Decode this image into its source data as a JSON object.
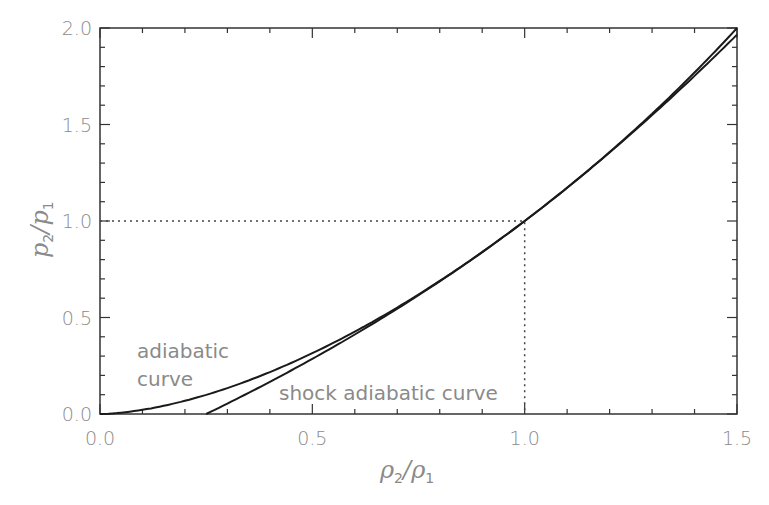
{
  "chart_data": {
    "type": "line",
    "title": "",
    "xlabel": "ρ2/ρ1",
    "ylabel": "p2/p1",
    "xlim": [
      0.0,
      1.5
    ],
    "ylim": [
      0.0,
      2.0
    ],
    "grid": false,
    "x_ticks": [
      "0.0",
      "0.5",
      "1.0",
      "1.5"
    ],
    "y_ticks": [
      "0.0",
      "0.5",
      "1.0",
      "1.5",
      "2.0"
    ],
    "series": [
      {
        "name": "adiabatic curve",
        "x": [
          0.0,
          0.1,
          0.2,
          0.3,
          0.4,
          0.5,
          0.6,
          0.7,
          0.8,
          0.9,
          1.0,
          1.1,
          1.2,
          1.3,
          1.4,
          1.5
        ],
        "values": [
          0.0,
          0.022,
          0.068,
          0.134,
          0.217,
          0.315,
          0.427,
          0.552,
          0.689,
          0.839,
          1.0,
          1.172,
          1.355,
          1.549,
          1.753,
          1.966
        ]
      },
      {
        "name": "shock adiabatic curve",
        "x": [
          0.25,
          0.3,
          0.4,
          0.5,
          0.6,
          0.7,
          0.8,
          0.9,
          1.0,
          1.1,
          1.2,
          1.3,
          1.4,
          1.5
        ],
        "values": [
          0.0,
          0.053,
          0.16,
          0.273,
          0.391,
          0.515,
          0.647,
          0.786,
          1.0,
          1.09,
          1.255,
          1.43,
          1.615,
          2.0
        ]
      }
    ],
    "annotations": [
      {
        "text": "adiabatic",
        "line2": "curve"
      },
      {
        "text": "shock adiabatic curve"
      },
      {
        "type": "dotted-guide",
        "x": 1.0,
        "y": 1.0
      }
    ]
  },
  "labels": {
    "xlabel_main": "ρ",
    "xlabel_sub1": "2",
    "xlabel_slash": "/",
    "xlabel_main2": "ρ",
    "xlabel_sub2": "1",
    "ylabel_main": "p",
    "ylabel_sub1": "2",
    "ylabel_slash": "/",
    "ylabel_main2": "p",
    "ylabel_sub2": "1",
    "ann_adiabatic_1": "adiabatic",
    "ann_adiabatic_2": "curve",
    "ann_shock": "shock adiabatic curve"
  }
}
